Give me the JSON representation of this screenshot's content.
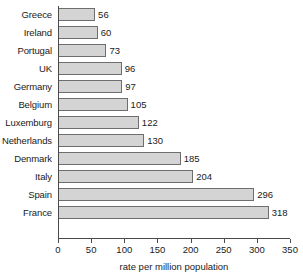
{
  "chart_data": {
    "type": "bar",
    "orientation": "horizontal",
    "title": "",
    "xlabel": "rate per million population",
    "ylabel": "",
    "xlim": [
      0,
      350
    ],
    "xticks": [
      0,
      50,
      100,
      150,
      200,
      250,
      300,
      350
    ],
    "grid": false,
    "legend": null,
    "show_value_labels": true,
    "categories": [
      "Greece",
      "Ireland",
      "Portugal",
      "UK",
      "Germany",
      "Belgium",
      "Luxemburg",
      "Netherlands",
      "Denmark",
      "Italy",
      "Spain",
      "France"
    ],
    "values": [
      56,
      60,
      73,
      96,
      97,
      105,
      122,
      130,
      185,
      204,
      296,
      318
    ],
    "value_labels": [
      "56",
      "60",
      "73",
      "96",
      "97",
      "105",
      "122",
      "130",
      "185",
      "204",
      "296",
      "318"
    ],
    "tick_labels": [
      "0",
      "50",
      "100",
      "150",
      "200",
      "250",
      "300",
      "350"
    ],
    "colors": {
      "bar_fill": "#d4d4d4",
      "bar_stroke": "#6e6e6e",
      "axis": "#4a4a4a",
      "text": "#1a1a1a",
      "background": "#ffffff"
    }
  }
}
